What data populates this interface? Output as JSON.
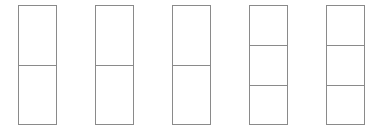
{
  "diagram": {
    "stroke_color": "#8a8a8a",
    "background_color": "#ffffff",
    "boxes": [
      {
        "id": "box-1",
        "x": 18,
        "y": 5,
        "width": 39,
        "height": 120,
        "sections": 2,
        "dividers_y": [
          60
        ]
      },
      {
        "id": "box-2",
        "x": 95,
        "y": 5,
        "width": 39,
        "height": 120,
        "sections": 2,
        "dividers_y": [
          60
        ]
      },
      {
        "id": "box-3",
        "x": 172,
        "y": 5,
        "width": 39,
        "height": 120,
        "sections": 2,
        "dividers_y": [
          60
        ]
      },
      {
        "id": "box-4",
        "x": 249,
        "y": 5,
        "width": 39,
        "height": 120,
        "sections": 3,
        "dividers_y": [
          40,
          80
        ]
      },
      {
        "id": "box-5",
        "x": 326,
        "y": 5,
        "width": 39,
        "height": 120,
        "sections": 3,
        "dividers_y": [
          40,
          80
        ]
      }
    ]
  }
}
